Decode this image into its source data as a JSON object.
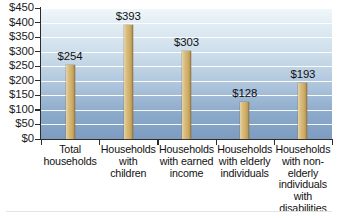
{
  "chart_data": {
    "type": "bar",
    "title": "",
    "xlabel": "",
    "ylabel": "",
    "ylim": [
      0,
      450
    ],
    "grid": true,
    "legend": "none",
    "categories": [
      "Total households",
      "Households with children",
      "Households with earned income",
      "Households with elderly individuals",
      "Households with non-elderly individuals with disabilities"
    ],
    "category_lines": [
      [
        "Total",
        "households"
      ],
      [
        "Households",
        "with",
        "children"
      ],
      [
        "Households",
        "with earned",
        "income"
      ],
      [
        "Households",
        "with elderly",
        "individuals"
      ],
      [
        "Households",
        "with non-",
        "elderly",
        "individuals",
        "with",
        "disabilities"
      ]
    ],
    "values": [
      254,
      393,
      303,
      128,
      193
    ],
    "value_labels": [
      "$254",
      "$393",
      "$303",
      "$128",
      "$193"
    ],
    "y_ticks": [
      0,
      50,
      100,
      150,
      200,
      250,
      300,
      350,
      400,
      450
    ],
    "y_tick_labels": [
      "$0",
      "$50",
      "$100",
      "$150",
      "$200",
      "$250",
      "$300",
      "$350",
      "$400",
      "$450"
    ]
  },
  "colors": {
    "bar_fill": "#d6b877",
    "bar_shadow": "#8c6f3c",
    "plot_top": "#f2f8fb",
    "plot_bottom": "#7d9cc0",
    "gridline": "#ffffff",
    "axis": "#2c2c2c",
    "text": "#111111"
  }
}
